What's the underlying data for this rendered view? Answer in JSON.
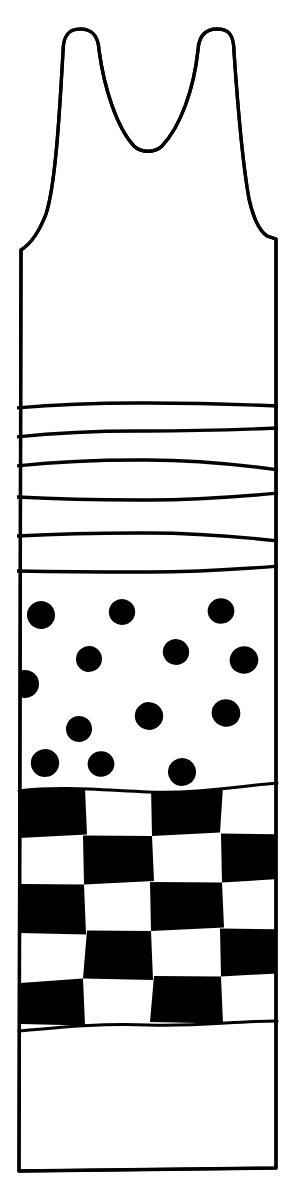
{
  "illustration": {
    "title": "Sleeveless Tank Top Line Drawing",
    "subject": "tank-top-garment",
    "style": "hand-drawn-black-ink-line-art",
    "canvas": {
      "width": 295,
      "height": 1178,
      "background_color": "#ffffff"
    },
    "colors": {
      "ink": "#000000",
      "fill": "#ffffff",
      "pattern_dark": "#000000",
      "pattern_light": "#ffffff"
    },
    "stroke": {
      "outline_width": 3.2,
      "stripe_width": 3.4
    }
  },
  "garment": {
    "name": "tank-top",
    "outline": {
      "label": "Garment Outline",
      "left_strap_outer_x": 62,
      "right_strap_outer_x": 233,
      "strap_top_y": 30,
      "neckline_bottom_y": 152,
      "neckline_center_x": 148,
      "left_side_seam_x": 19,
      "right_side_seam_x": 276,
      "armhole_join_left_y": 250,
      "armhole_join_right_y": 236,
      "hem_y": 1171,
      "hem_left_x": 16,
      "hem_right_x": 271,
      "path": "M 63 52 C 63 34 70 29 80 29 C 91 29 98 34 99 50 C 104 88 117 128 134 146 C 141 153 155 153 162 146 C 181 126 194 88 198 50 C 199 34 207 29 217 29 C 228 29 234 34 234 52 C 237 96 242 160 249 199 C 254 221 261 232 267 236 L 276 239 L 276 1168 L 19 1171 L 21 250 C 29 245 38 235 46 214 C 56 184 60 104 63 52 Z"
    },
    "bands": [
      {
        "id": "band-plain-top",
        "label": "Plain Upper Bodice",
        "pattern": "plain",
        "top_y": 239,
        "bottom_y": 406,
        "fill": "#ffffff"
      },
      {
        "id": "band-stripes",
        "label": "Horizontal Wavy Stripe Band",
        "pattern": "stripes",
        "top_y": 406,
        "bottom_y": 583,
        "stripe_count": 6,
        "stripe_color": "#000000",
        "stripe_lines": [
          {
            "index": 1,
            "left_y": 408,
            "mid_y": 403,
            "right_y": 406
          },
          {
            "index": 2,
            "left_y": 437,
            "mid_y": 431,
            "right_y": 428
          },
          {
            "index": 3,
            "left_y": 466,
            "mid_y": 460,
            "right_y": 470
          },
          {
            "index": 4,
            "left_y": 497,
            "mid_y": 500,
            "right_y": 493
          },
          {
            "index": 5,
            "left_y": 536,
            "mid_y": 533,
            "right_y": 541
          },
          {
            "index": 6,
            "left_y": 571,
            "mid_y": 572,
            "right_y": 566
          }
        ]
      },
      {
        "id": "band-polkadots",
        "label": "Polka Dot Band",
        "pattern": "polka-dots",
        "top_y": 583,
        "bottom_y": 787,
        "dot_color": "#000000",
        "dot_count": 14,
        "dot_radius_avg": 13,
        "dots": [
          {
            "cx": 41,
            "cy": 615,
            "r": 14
          },
          {
            "cx": 122,
            "cy": 612,
            "r": 13
          },
          {
            "cx": 221,
            "cy": 611,
            "r": 13
          },
          {
            "cx": 89,
            "cy": 659,
            "r": 13
          },
          {
            "cx": 176,
            "cy": 652,
            "r": 13
          },
          {
            "cx": 244,
            "cy": 660,
            "r": 14
          },
          {
            "cx": 25,
            "cy": 684,
            "r": 14
          },
          {
            "cx": 149,
            "cy": 716,
            "r": 14
          },
          {
            "cx": 226,
            "cy": 713,
            "r": 14
          },
          {
            "cx": 79,
            "cy": 729,
            "r": 13
          },
          {
            "cx": 45,
            "cy": 763,
            "r": 14
          },
          {
            "cx": 101,
            "cy": 764,
            "r": 13
          },
          {
            "cx": 182,
            "cy": 772,
            "r": 14
          }
        ]
      },
      {
        "id": "band-checkerboard",
        "label": "Checkerboard Band",
        "pattern": "checkerboard",
        "top_y": 787,
        "bottom_y": 1026,
        "rows": 5,
        "columns": 4,
        "cell_width_avg": 65,
        "cell_height_avg": 48,
        "dark_color": "#000000",
        "light_color": "#ffffff",
        "grid": [
          [
            1,
            0,
            1,
            0
          ],
          [
            0,
            1,
            0,
            1
          ],
          [
            1,
            0,
            1,
            0
          ],
          [
            0,
            1,
            0,
            1
          ],
          [
            1,
            0,
            1,
            0
          ]
        ],
        "column_edges": [
          19,
          85,
          152,
          222,
          277
        ],
        "row_edges": [
          789,
          838,
          886,
          934,
          981,
          1026
        ]
      },
      {
        "id": "band-plain-bottom",
        "label": "Plain Lower Skirt",
        "pattern": "plain",
        "top_y": 1026,
        "bottom_y": 1171,
        "fill": "#ffffff"
      }
    ]
  },
  "legend": {
    "band_order": [
      "Plain Upper Bodice",
      "Horizontal Wavy Stripe Band",
      "Polka Dot Band",
      "Checkerboard Band",
      "Plain Lower Skirt"
    ]
  }
}
